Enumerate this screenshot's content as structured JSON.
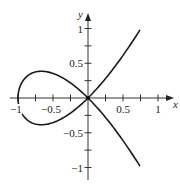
{
  "chart_data": {
    "type": "line",
    "title": "",
    "xlabel": "x",
    "ylabel": "y",
    "xlim": [
      -1.0,
      1.25
    ],
    "ylim": [
      -1.15,
      1.2
    ],
    "grid": false,
    "x_ticks": [
      -1,
      -0.75,
      -0.5,
      -0.25,
      0.25,
      0.5,
      0.75,
      1
    ],
    "x_tick_labels": [
      {
        "value": -1,
        "label": "−1"
      },
      {
        "value": -0.5,
        "label": "−0.5"
      },
      {
        "value": 0.5,
        "label": "0.5"
      },
      {
        "value": 1,
        "label": "1"
      }
    ],
    "y_ticks": [
      -1,
      -0.75,
      -0.5,
      -0.25,
      0.25,
      0.5,
      0.75,
      1
    ],
    "y_tick_labels": [
      {
        "value": 1,
        "label": "1"
      },
      {
        "value": 0.5,
        "label": "0.5"
      },
      {
        "value": -0.5,
        "label": "−0.5"
      },
      {
        "value": -1,
        "label": "−1"
      }
    ],
    "series": [
      {
        "name": "parametric curve x = t^2 - 1, y = t^3 - t",
        "param_range": [
          -1.32,
          1.32
        ],
        "points": [
          [
            0.75,
            -1.0
          ],
          [
            0.44,
            -0.76
          ],
          [
            0.21,
            -0.55
          ],
          [
            0.0,
            0.0
          ],
          [
            -0.36,
            0.32
          ],
          [
            -0.67,
            0.385
          ],
          [
            -0.91,
            0.29
          ],
          [
            -1.0,
            0.0
          ],
          [
            -0.91,
            -0.29
          ],
          [
            -0.67,
            -0.385
          ],
          [
            -0.36,
            -0.32
          ],
          [
            0.0,
            0.0
          ],
          [
            0.21,
            0.55
          ],
          [
            0.44,
            0.76
          ],
          [
            0.75,
            1.0
          ]
        ]
      }
    ],
    "annotations": [
      {
        "type": "point",
        "x": 0,
        "y": 0,
        "label": "double point at origin"
      }
    ]
  },
  "axes": {
    "x_label": "x",
    "y_label": "y"
  }
}
